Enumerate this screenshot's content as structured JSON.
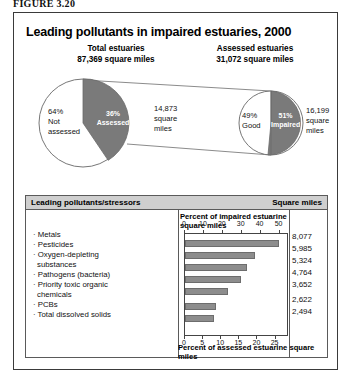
{
  "figure": {
    "label": "FIGURE 3.20"
  },
  "chart": {
    "title": "Leading pollutants in impaired estuaries, 2000"
  },
  "pies": {
    "left": {
      "heading_line1": "Total estuaries",
      "heading_line2": "87,369 square miles",
      "slice_assessed_label_line1": "36%",
      "slice_assessed_label_line2": "Assessed",
      "slice_not_assessed_line1": "64%",
      "slice_not_assessed_line2": "Not",
      "slice_not_assessed_line3": "assessed"
    },
    "right": {
      "heading_line1": "Assessed estuaries",
      "heading_line2": "31,072 square miles",
      "slice_good_line1": "49%",
      "slice_good_line2": "Good",
      "slice_impaired_line1": "51%",
      "slice_impaired_line2": "Impaired",
      "callout_left_line1": "14,873",
      "callout_left_line2": "square",
      "callout_left_line3": "miles",
      "callout_right_line1": "16,199",
      "callout_right_line2": "square",
      "callout_right_line3": "miles"
    }
  },
  "table": {
    "header_left": "Leading pollutants/stressors",
    "header_right": "Square miles"
  },
  "chart_data": {
    "type": "bar",
    "orientation": "horizontal",
    "title": "Leading pollutants in impaired estuaries, 2000",
    "xlabel_top": "Percent of impaired estuarine square miles",
    "xlabel_bottom": "Percent of assessed estuarine square miles",
    "ylabel": "Leading pollutants/stressors",
    "grid": false,
    "legend": "none",
    "xlim_top": [
      0,
      55
    ],
    "xlim_bottom": [
      0,
      28.7
    ],
    "xticks_top": [
      0,
      10,
      20,
      30,
      40,
      50
    ],
    "xticks_bottom": [
      0,
      5,
      10,
      15,
      20,
      25
    ],
    "categories": [
      "Metals",
      "Pesticides",
      "Oxygen-depleting substances",
      "Pathogens (bacteria)",
      "Priority toxic organic chemicals",
      "PCBs",
      "Total dissolved solids"
    ],
    "category_labels": [
      "· Metals",
      "· Pesticides",
      "· Oxygen-depleting",
      "  substances",
      "· Pathogens (bacteria)",
      "· Priority toxic organic",
      "  chemicals",
      "· PCBs",
      "· Total dissolved solids"
    ],
    "values_percent_impaired": [
      49.9,
      36.9,
      32.9,
      29.4,
      22.5,
      16.2,
      15.4
    ],
    "values_square_miles": [
      "8,077",
      "5,985",
      "5,324",
      "4,764",
      "3,652",
      "2,622",
      "2,494"
    ],
    "square_miles_numeric": [
      8077,
      5985,
      5324,
      4764,
      3652,
      2622,
      2494
    ],
    "bar_color": "#8d8d8d"
  },
  "colors": {
    "dark_slice": "#7a7a7a",
    "light_slice": "#ffffff",
    "bar": "#8d8d8d",
    "frame": "#3a3a3a",
    "header_bg": "#cfcfcf"
  }
}
